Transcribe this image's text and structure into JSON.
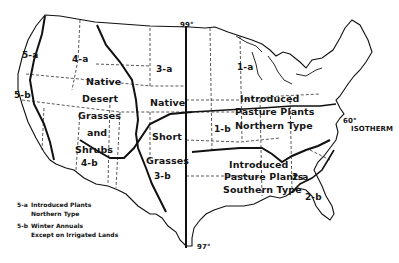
{
  "map": {
    "title": "",
    "meridians": {
      "top_label": "99°",
      "bottom_label": "97°"
    },
    "isotherm": {
      "degree": "60°",
      "label": "ISOTHERM"
    },
    "regions": {
      "r1a": "1-a",
      "r1b": "1-b",
      "r2a": "2-a",
      "r2b": "2-b",
      "r3a": "3-a",
      "r3b": "3-b",
      "r4a": "4-a",
      "r4b": "4-b",
      "r5a": "5-a",
      "r5b": "5-b"
    },
    "zone_labels": {
      "west": [
        "Native",
        "Desert",
        "Grasses",
        "and",
        "Shrubs"
      ],
      "plains_native": "Native",
      "plains_short": "Short",
      "plains_grasses": "Grasses",
      "north": [
        "Introduced",
        "Pasture Plants",
        "Northern Type"
      ],
      "south": [
        "Introduced",
        "Pasture Plants",
        "Southern Type"
      ]
    },
    "legend": [
      {
        "code": "5-a",
        "line1": "Introduced Plants",
        "line2": "Northern Type"
      },
      {
        "code": "5-b",
        "line1": "Winter Annuals",
        "line2": "Except on Irrigated Lands"
      }
    ],
    "colors": {
      "ink": "#111111",
      "paper": "#ffffff"
    }
  }
}
